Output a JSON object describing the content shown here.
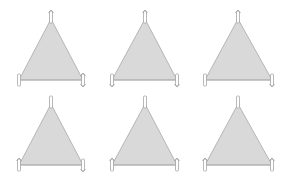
{
  "colors": {
    "background": "#ffffff",
    "triangle_fill": "#d9d9d9",
    "triangle_stroke": "#a8a8a8",
    "marker_fill": "#ffffff",
    "marker_stroke": "#9a9a9a"
  },
  "triangles": [
    {
      "id": "t1",
      "apex": [
        51,
        19
      ],
      "left": [
        19,
        80
      ],
      "right": [
        83,
        80
      ],
      "markers": {
        "apex": "up",
        "left": "bar",
        "right": "up-down"
      }
    },
    {
      "id": "t2",
      "apex": [
        145,
        19
      ],
      "left": [
        112,
        80
      ],
      "right": [
        177,
        80
      ],
      "markers": {
        "apex": "up",
        "left": "down",
        "right": "down"
      }
    },
    {
      "id": "t3",
      "apex": [
        238,
        19
      ],
      "left": [
        205,
        80
      ],
      "right": [
        272,
        80
      ],
      "markers": {
        "apex": "up",
        "left": "bar",
        "right": "down"
      }
    },
    {
      "id": "t4",
      "apex": [
        51,
        104
      ],
      "left": [
        19,
        165
      ],
      "right": [
        83,
        165
      ],
      "markers": {
        "apex": "bar",
        "left": "up",
        "right": "down"
      }
    },
    {
      "id": "t5",
      "apex": [
        145,
        104
      ],
      "left": [
        112,
        165
      ],
      "right": [
        177,
        165
      ],
      "markers": {
        "apex": "bar",
        "left": "up",
        "right": "up"
      }
    },
    {
      "id": "t6",
      "apex": [
        238,
        104
      ],
      "left": [
        205,
        165
      ],
      "right": [
        272,
        165
      ],
      "markers": {
        "apex": "bar",
        "left": "up",
        "right": "up"
      }
    }
  ]
}
